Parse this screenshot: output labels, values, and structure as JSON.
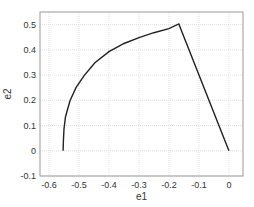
{
  "chart_data": {
    "type": "line",
    "title": "",
    "xlabel": "e1",
    "ylabel": "e2",
    "xlim": [
      -0.63,
      0.047
    ],
    "ylim": [
      -0.1,
      0.55
    ],
    "grid": true,
    "legend": null,
    "xticks": [
      -0.6,
      -0.5,
      -0.4,
      -0.3,
      -0.2,
      -0.1,
      0
    ],
    "xtick_labels": [
      "-0.6",
      "-0.5",
      "-0.4",
      "-0.3",
      "-0.2",
      "-0.1",
      "0"
    ],
    "yticks": [
      -0.1,
      0,
      0.1,
      0.2,
      0.3,
      0.4,
      0.5
    ],
    "ytick_labels": [
      "-0.1",
      "0",
      "0.1",
      "0.2",
      "0.3",
      "0.4",
      "0.5"
    ],
    "series": [
      {
        "name": "e2 vs e1",
        "color": "#222222",
        "x": [
          -0.553,
          -0.552,
          -0.55,
          -0.545,
          -0.53,
          -0.51,
          -0.483,
          -0.447,
          -0.4,
          -0.35,
          -0.3,
          -0.25,
          -0.2,
          -0.167,
          0.0
        ],
        "y": [
          0.0,
          0.04,
          0.087,
          0.135,
          0.198,
          0.25,
          0.298,
          0.349,
          0.393,
          0.425,
          0.448,
          0.468,
          0.484,
          0.503,
          0.0
        ]
      }
    ]
  },
  "axes": {
    "left": 40,
    "top": 12,
    "right": 243,
    "bottom": 176
  }
}
